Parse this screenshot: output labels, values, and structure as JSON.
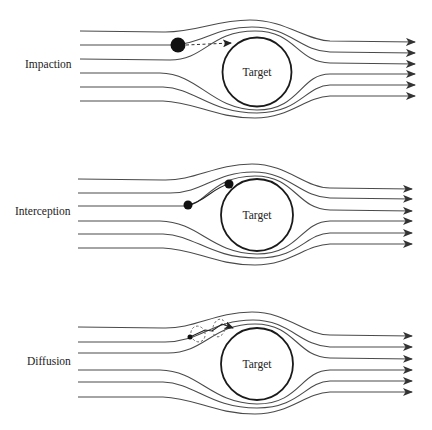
{
  "figure": {
    "width": 432,
    "height": 430,
    "colors": {
      "background": "#ffffff",
      "streamline": "#4a4a4a",
      "target_outline": "#1a1a1a",
      "particle": "#111111",
      "text": "#222222"
    },
    "panels": [
      {
        "id": "impaction",
        "label": "Impaction",
        "label_pos": [
          25,
          70
        ],
        "target": {
          "label": "Target",
          "cx": 257,
          "cy": 72,
          "r": 34.5
        },
        "streamlines_y_left": [
          31,
          45,
          59,
          73,
          87,
          101
        ],
        "streamlines_y_right": [
          42,
          53,
          64,
          74,
          85,
          96
        ],
        "streamline_x_start": 80,
        "streamline_x_end": 415,
        "particles": [
          {
            "cx": 178,
            "cy": 45,
            "r": 7.5
          }
        ],
        "trajectory": {
          "type": "dashed-arrow",
          "from": [
            186,
            45
          ],
          "to": [
            232,
            43
          ]
        }
      },
      {
        "id": "interception",
        "label": "Interception",
        "label_pos": [
          15,
          217
        ],
        "target": {
          "label": "Target",
          "cx": 257,
          "cy": 215,
          "r": 36
        },
        "streamlines_y_left": [
          179,
          193,
          206,
          221,
          234,
          248
        ],
        "streamlines_y_right": [
          189,
          199,
          211,
          221,
          233,
          244
        ],
        "streamline_x_start": 78,
        "streamline_x_end": 412,
        "particles": [
          {
            "cx": 188,
            "cy": 205,
            "r": 4.5
          },
          {
            "cx": 229,
            "cy": 184,
            "r": 4.5
          }
        ],
        "trajectory": {
          "type": "solid-curve",
          "from": [
            188,
            205
          ],
          "to": [
            229,
            184
          ]
        }
      },
      {
        "id": "diffusion",
        "label": "Diffusion",
        "label_pos": [
          27,
          367
        ],
        "target": {
          "label": "Target",
          "cx": 257,
          "cy": 364,
          "r": 36
        },
        "streamlines_y_left": [
          327,
          342,
          353,
          370,
          382,
          397
        ],
        "streamlines_y_right": [
          336,
          347,
          359,
          370,
          381,
          392
        ],
        "streamline_x_start": 78,
        "streamline_x_end": 412,
        "particles": [
          {
            "cx": 190,
            "cy": 337,
            "r": 2.5
          }
        ],
        "trajectory": {
          "type": "brownian",
          "from": [
            190,
            337
          ],
          "to": [
            233,
            326
          ]
        }
      }
    ]
  }
}
